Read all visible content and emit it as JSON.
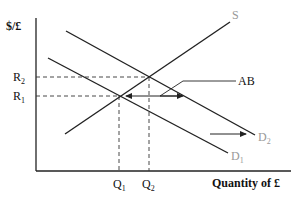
{
  "diagram": {
    "type": "supply-demand",
    "y_axis_label": "$/£",
    "x_axis_label": "Quantity of £",
    "price_levels": [
      {
        "label": "R",
        "sub": "2",
        "y": 77
      },
      {
        "label": "R",
        "sub": "1",
        "y": 96
      }
    ],
    "quantity_levels": [
      {
        "label": "Q",
        "sub": "1",
        "x": 119
      },
      {
        "label": "Q",
        "sub": "2",
        "x": 149
      }
    ],
    "curves": [
      {
        "name": "S",
        "label": "S",
        "from": [
          65,
          134
        ],
        "to": [
          230,
          22
        ]
      },
      {
        "name": "D1",
        "label": "D",
        "sub": "1",
        "from": [
          48,
          58
        ],
        "to": [
          228,
          153
        ]
      },
      {
        "name": "D2",
        "label": "D",
        "sub": "2",
        "from": [
          66,
          31
        ],
        "to": [
          255,
          135
        ]
      }
    ],
    "annotations": {
      "ab_label": "AB",
      "shift_arrow": "demand shift right"
    },
    "colors": {
      "line": "#222222",
      "label_light": "#999999"
    }
  }
}
